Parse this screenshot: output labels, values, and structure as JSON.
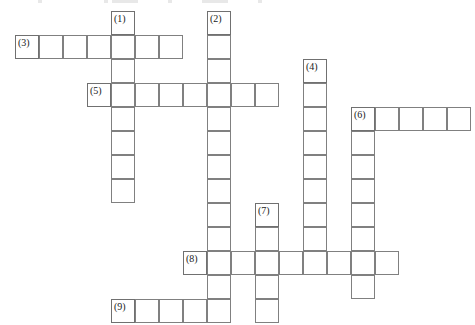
{
  "puzzle": {
    "title": "Crossword Puzzle Grid",
    "cell_size_px": 24,
    "origin_x_px": 15,
    "origin_y_px": 11,
    "columns": 19,
    "rows": 13,
    "colors": {
      "grid_line": "#808080",
      "cell_background": "#ffffff",
      "page_background": "#ffffff",
      "clue_number_text": "#1a1a1a"
    },
    "entries": [
      {
        "number": "(1)",
        "label": "1",
        "direction": "down",
        "start_col": 4,
        "start_row": 0,
        "length": 8,
        "answer": ""
      },
      {
        "number": "(2)",
        "label": "2",
        "direction": "down",
        "start_col": 8,
        "start_row": 0,
        "length": 13,
        "answer": ""
      },
      {
        "number": "(3)",
        "label": "3",
        "direction": "across",
        "start_col": 0,
        "start_row": 1,
        "length": 7,
        "answer": ""
      },
      {
        "number": "(4)",
        "label": "4",
        "direction": "down",
        "start_col": 12,
        "start_row": 2,
        "length": 8,
        "answer": ""
      },
      {
        "number": "(5)",
        "label": "5",
        "direction": "across",
        "start_col": 3,
        "start_row": 3,
        "length": 8,
        "answer": ""
      },
      {
        "number": "(6)",
        "label": "6",
        "direction": "across",
        "start_col": 14,
        "start_row": 4,
        "length": 5,
        "answer": ""
      },
      {
        "number": "(6)",
        "label": "6",
        "direction": "down",
        "start_col": 14,
        "start_row": 4,
        "length": 8,
        "answer": "",
        "share_number_with_across": true
      },
      {
        "number": "(7)",
        "label": "7",
        "direction": "down",
        "start_col": 10,
        "start_row": 8,
        "length": 5,
        "answer": ""
      },
      {
        "number": "(8)",
        "label": "8",
        "direction": "across",
        "start_col": 7,
        "start_row": 10,
        "length": 9,
        "answer": ""
      },
      {
        "number": "(9)",
        "label": "9",
        "direction": "across",
        "start_col": 4,
        "start_row": 12,
        "length": 5,
        "answer": ""
      }
    ],
    "numbered_cells": [
      {
        "number": "(1)",
        "col": 4,
        "row": 0
      },
      {
        "number": "(2)",
        "col": 8,
        "row": 0
      },
      {
        "number": "(3)",
        "col": 0,
        "row": 1
      },
      {
        "number": "(4)",
        "col": 12,
        "row": 2
      },
      {
        "number": "(5)",
        "col": 3,
        "row": 3
      },
      {
        "number": "(6)",
        "col": 14,
        "row": 4
      },
      {
        "number": "(7)",
        "col": 10,
        "row": 8
      },
      {
        "number": "(8)",
        "col": 7,
        "row": 10
      },
      {
        "number": "(9)",
        "col": 4,
        "row": 12
      }
    ],
    "top_artifacts": [
      {
        "x": 38,
        "width": 4
      },
      {
        "x": 104,
        "width": 4
      },
      {
        "x": 112,
        "width": 26
      },
      {
        "x": 168,
        "width": 4
      },
      {
        "x": 202,
        "width": 26
      },
      {
        "x": 258,
        "width": 4
      }
    ]
  }
}
